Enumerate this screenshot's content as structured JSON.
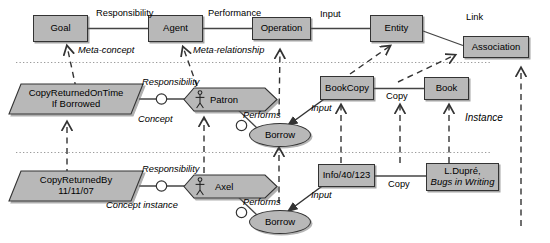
{
  "diagram": {
    "colors": {
      "node_fill": "#b8b8b8",
      "node_stroke": "#333333",
      "separator": "#999999",
      "line": "#444444"
    },
    "tiers": [
      {
        "name": "meta-level"
      },
      {
        "name": "concept-level"
      },
      {
        "name": "instance-level"
      }
    ],
    "nodes": {
      "goal": {
        "label": "Goal",
        "shape": "rect"
      },
      "agent": {
        "label": "Agent",
        "shape": "rect"
      },
      "operation": {
        "label": "Operation",
        "shape": "rect"
      },
      "entity": {
        "label": "Entity",
        "shape": "rect"
      },
      "association": {
        "label": "Association",
        "shape": "rect"
      },
      "copy_returned_on_time": {
        "label_line1": "CopyReturnedOnTime",
        "label_line2": "If Borrowed",
        "shape": "parallelogram"
      },
      "patron": {
        "label": "Patron",
        "shape": "hexagon-actor"
      },
      "borrow_concept": {
        "label": "Borrow",
        "shape": "ellipse"
      },
      "bookcopy": {
        "label": "BookCopy",
        "shape": "rect"
      },
      "book": {
        "label": "Book",
        "shape": "rect"
      },
      "copy_returned_by": {
        "label_line1": "CopyReturnedBy",
        "label_line2": "11/11/07",
        "shape": "parallelogram"
      },
      "axel": {
        "label": "Axel",
        "shape": "hexagon-actor"
      },
      "borrow_instance": {
        "label": "Borrow",
        "shape": "ellipse"
      },
      "info_40_123": {
        "label": "Info/40/123",
        "shape": "rect"
      },
      "ldupre_book": {
        "label_line1": "L.Dupré,",
        "label_line2": "Bugs in Writing",
        "shape": "rect"
      }
    },
    "edge_labels": {
      "responsibility_meta": "Responsibility",
      "performance": "Performance",
      "input_meta": "Input",
      "link": "Link",
      "meta_concept": "Meta-concept",
      "meta_relationship": "Meta-relationship",
      "responsibility_concept": "Responsibility",
      "concept": "Concept",
      "performs_concept": "Performs",
      "input_concept": "Input",
      "copy_concept": "Copy",
      "responsibility_instance": "Responsibility",
      "concept_instance": "Concept instance",
      "performs_instance": "Performs",
      "input_instance": "Input",
      "copy_instance": "Copy",
      "instance": "Instance"
    },
    "icons": {
      "actor": "stick-figure-icon"
    }
  }
}
